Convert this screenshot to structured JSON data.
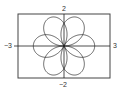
{
  "chart_data": {
    "type": "line",
    "title": "",
    "xlabel": "",
    "ylabel": "",
    "xlim": [
      -3,
      3
    ],
    "ylim": [
      -2,
      2
    ],
    "grid": false,
    "legend": null,
    "tick_labels": {
      "x_min": "−3",
      "x_max": "3",
      "y_max": "2",
      "y_min": "−2"
    },
    "series": [
      {
        "name": "polar rose",
        "kind": "polar",
        "formula": "r = 2cos(3θ/2)",
        "amplitude": 2,
        "frequency": 1.5,
        "theta_range": [
          0,
          12.566
        ],
        "color": "#222222"
      }
    ]
  },
  "frame": {
    "left": 18,
    "top": 14,
    "right": 110,
    "bottom": 78,
    "color": "#444444"
  }
}
